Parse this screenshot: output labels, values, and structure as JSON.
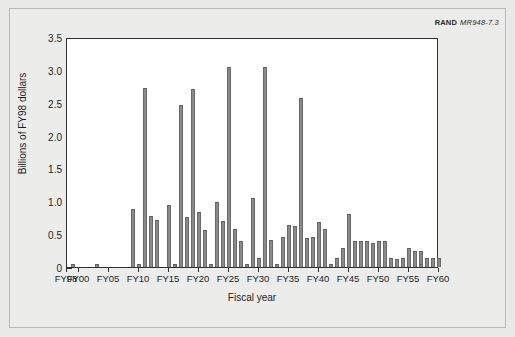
{
  "credit": {
    "organization": "RAND",
    "figure_code": "MR948-7.3"
  },
  "chart_data": {
    "type": "bar",
    "title": "",
    "xlabel": "Fiscal year",
    "ylabel": "Billions of FY98 dollars",
    "xlim": [
      "FY98",
      "FY60"
    ],
    "ylim": [
      0,
      3.5
    ],
    "yticks": [
      0,
      0.5,
      1.0,
      1.5,
      2.0,
      2.5,
      3.0,
      3.5
    ],
    "ytick_labels": [
      "0",
      "0.5",
      "1.0",
      "1.5",
      "2.0",
      "2.5",
      "3.0",
      "3.5"
    ],
    "xtick_labels": [
      "FY98",
      "FY00",
      "FY05",
      "FY10",
      "FY15",
      "FY20",
      "FY25",
      "FY30",
      "FY35",
      "FY40",
      "FY45",
      "FY50",
      "FY55",
      "FY60"
    ],
    "xtick_years": [
      1998,
      2000,
      2005,
      2010,
      2015,
      2020,
      2025,
      2030,
      2035,
      2040,
      2045,
      2050,
      2055,
      2060
    ],
    "grid": false,
    "legend": false,
    "bar_color": "#8a8a8a",
    "categories": [
      "FY98",
      "FY99",
      "FY00",
      "FY01",
      "FY02",
      "FY03",
      "FY04",
      "FY05",
      "FY06",
      "FY07",
      "FY08",
      "FY09",
      "FY10",
      "FY11",
      "FY12",
      "FY13",
      "FY14",
      "FY15",
      "FY16",
      "FY17",
      "FY18",
      "FY19",
      "FY20",
      "FY21",
      "FY22",
      "FY23",
      "FY24",
      "FY25",
      "FY26",
      "FY27",
      "FY28",
      "FY29",
      "FY30",
      "FY31",
      "FY32",
      "FY33",
      "FY34",
      "FY35",
      "FY36",
      "FY37",
      "FY38",
      "FY39",
      "FY40",
      "FY41",
      "FY42",
      "FY43",
      "FY44",
      "FY45",
      "FY46",
      "FY47",
      "FY48",
      "FY49",
      "FY50",
      "FY51",
      "FY52",
      "FY53",
      "FY54",
      "FY55",
      "FY56",
      "FY57",
      "FY58",
      "FY59",
      "FY60"
    ],
    "values": [
      0.0,
      0.05,
      0.0,
      0.0,
      0.0,
      0.05,
      0.0,
      0.0,
      0.0,
      0.0,
      0.0,
      0.89,
      0.04,
      2.73,
      0.77,
      0.72,
      0.0,
      0.94,
      0.04,
      2.47,
      0.76,
      2.71,
      0.84,
      0.57,
      0.05,
      0.99,
      0.7,
      3.05,
      0.58,
      0.39,
      0.04,
      1.05,
      0.14,
      3.05,
      0.41,
      0.04,
      0.45,
      0.64,
      0.63,
      2.57,
      0.44,
      0.46,
      0.68,
      0.58,
      0.04,
      0.14,
      0.29,
      0.81,
      0.4,
      0.39,
      0.4,
      0.37,
      0.4,
      0.4,
      0.13,
      0.12,
      0.14,
      0.29,
      0.25,
      0.25,
      0.13,
      0.13,
      0.13
    ],
    "extra_bars": [
      {
        "year": 2056,
        "value": 0.25
      },
      {
        "year": 2057,
        "value": 0.04
      },
      {
        "year": 2058,
        "value": 0.13
      }
    ]
  }
}
